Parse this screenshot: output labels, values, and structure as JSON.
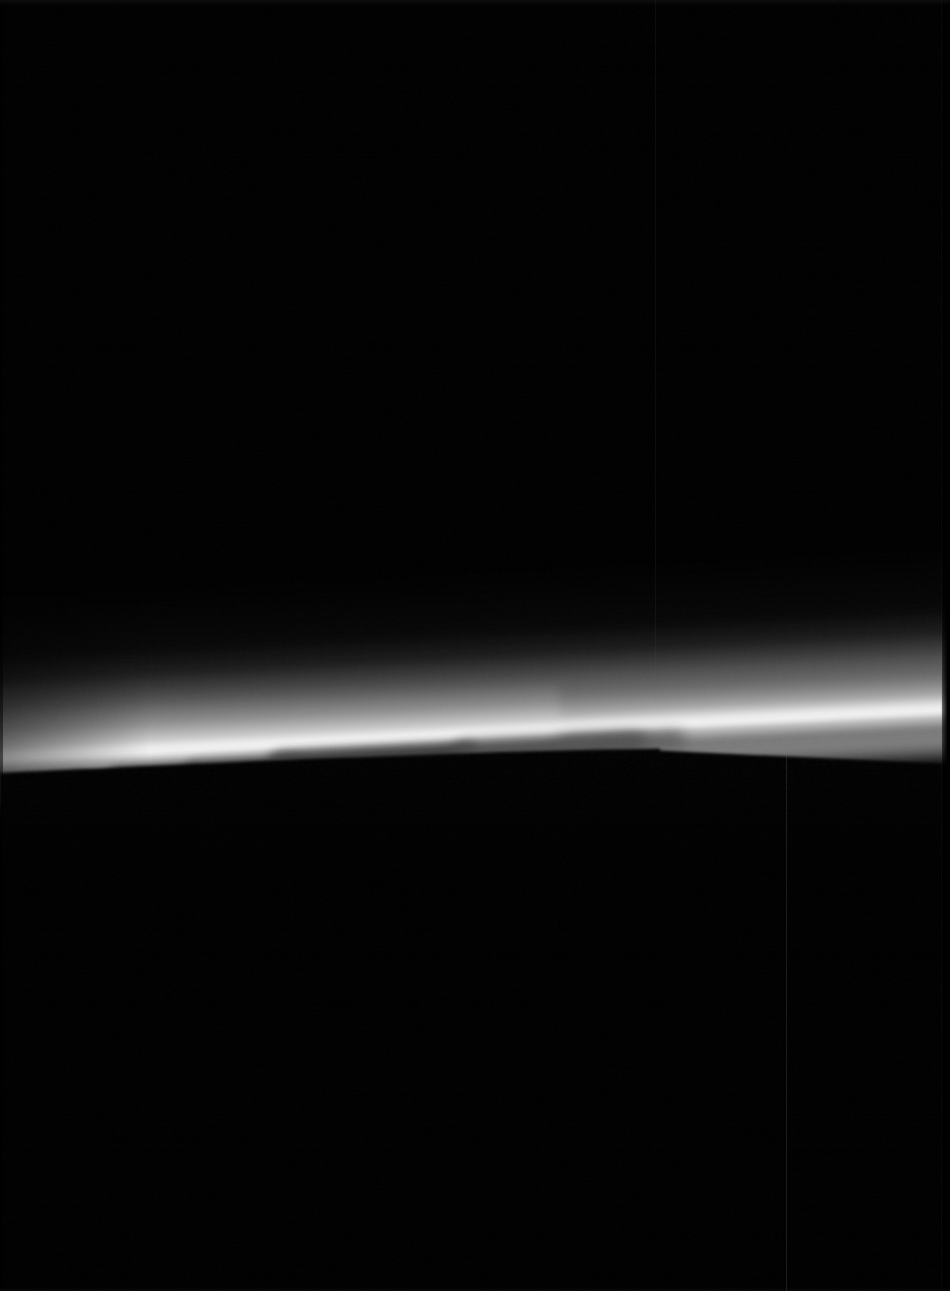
{
  "image": {
    "domain": "Natural-Image",
    "subject": "planetary-limb-haze",
    "title": "Planetary limb with atmospheric haze band",
    "width": 950,
    "height": 1291,
    "background_color": "#000000",
    "orientation": "portrait",
    "capture_style": "monochrome spacecraft narrow-angle camera frame"
  },
  "palette": {
    "space_black": "#000000",
    "deep_shadow": "#030303",
    "haze_faint": "#1c1c1c",
    "haze_mid": "#6e6e6e",
    "haze_bright": "#bdbdbd",
    "limb_core": "#f2f2f2",
    "limb_core_peak": "#ffffff",
    "cloud_gray": "#3a3a3a",
    "cloud_gray_light": "#575757",
    "artifact_line": "#202020",
    "edge_vignette": "#000000"
  },
  "limb": {
    "description": "Bright arc of sunlit atmospheric haze sweeping from lower-left to upper-right",
    "curve_points_px": [
      {
        "x": 0,
        "y": 767
      },
      {
        "x": 100,
        "y": 760
      },
      {
        "x": 200,
        "y": 753
      },
      {
        "x": 300,
        "y": 746
      },
      {
        "x": 400,
        "y": 740
      },
      {
        "x": 500,
        "y": 734
      },
      {
        "x": 600,
        "y": 729
      },
      {
        "x": 700,
        "y": 725
      },
      {
        "x": 800,
        "y": 722
      },
      {
        "x": 900,
        "y": 719
      },
      {
        "x": 950,
        "y": 718
      }
    ],
    "tilt_degrees": -3.0,
    "core_band_thickness_px": 22,
    "haze_extent_above_px": 95,
    "peak_brightness_hex": "#f4f4f4"
  },
  "haze_gradient_stops": [
    {
      "offset_pct": 0,
      "color": "rgba(0,0,0,0)"
    },
    {
      "offset_pct": 18,
      "color": "rgba(34,34,34,0.55)"
    },
    {
      "offset_pct": 40,
      "color": "rgba(88,88,88,0.80)"
    },
    {
      "offset_pct": 62,
      "color": "rgba(150,150,150,0.92)"
    },
    {
      "offset_pct": 78,
      "color": "rgba(214,214,214,0.98)"
    },
    {
      "offset_pct": 88,
      "color": "rgba(244,244,244,1)"
    },
    {
      "offset_pct": 94,
      "color": "rgba(188,188,188,0.85)"
    },
    {
      "offset_pct": 100,
      "color": "rgba(0,0,0,0)"
    }
  ],
  "cloud_shapes": [
    {
      "name": "cloud-blob-left-small",
      "x": 108,
      "y": 768,
      "w": 92,
      "h": 11,
      "tone": "#2a2a2a",
      "blur": 4
    },
    {
      "name": "cloud-blob-left-mid",
      "x": 186,
      "y": 762,
      "w": 120,
      "h": 13,
      "tone": "#343434",
      "blur": 5
    },
    {
      "name": "cloud-streak-center",
      "x": 268,
      "y": 752,
      "w": 210,
      "h": 16,
      "tone": "#3f3f3f",
      "blur": 5
    },
    {
      "name": "cloud-streak-center-low",
      "x": 300,
      "y": 762,
      "w": 170,
      "h": 12,
      "tone": "#2c2c2c",
      "blur": 6
    },
    {
      "name": "cloud-wedge-right",
      "x": 452,
      "y": 742,
      "w": 196,
      "h": 18,
      "tone": "#4a4a4a",
      "blur": 6
    },
    {
      "name": "cloud-tail-right",
      "x": 556,
      "y": 738,
      "w": 130,
      "h": 14,
      "tone": "#545454",
      "blur": 7
    },
    {
      "name": "cloud-faint-far-left",
      "x": 20,
      "y": 778,
      "w": 70,
      "h": 8,
      "tone": "#1d1d1d",
      "blur": 5
    }
  ],
  "ccd_artifacts": [
    {
      "name": "column-artifact-left",
      "x": 655,
      "y_start": 0,
      "y_end": 700,
      "width": 1,
      "opacity": 0.1,
      "color": "#6a6a6a"
    },
    {
      "name": "column-artifact-right",
      "x": 786,
      "y_start": 744,
      "y_end": 1291,
      "width": 1,
      "opacity": 0.22,
      "color": "#7a7a7a"
    },
    {
      "name": "column-artifact-far-right",
      "x": 941,
      "y_start": 0,
      "y_end": 1291,
      "width": 1,
      "opacity": 0.08,
      "color": "#555555"
    }
  ],
  "edges": {
    "right_dark_strip_x": 942,
    "right_dark_strip_width": 8,
    "top_noise_band_height": 6,
    "bottom_noise_band_height": 4
  },
  "notes": {
    "no_text_in_image": "This frame contains no rendered text, labels, axes, or UI chrome.",
    "dominant_feature": "Horizontal luminous haze arc across the lower-middle third of the frame",
    "lower_region": "Solid black night side of the body occupying the bottom ~40% of the frame",
    "upper_region": "Solid black space occupying the top ~52% of the frame"
  }
}
